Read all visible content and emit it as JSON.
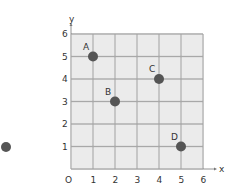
{
  "chart_data": {
    "type": "scatter",
    "title": "",
    "xlabel": "x",
    "ylabel": "y",
    "origin_label": "O",
    "xlim": [
      0,
      6
    ],
    "ylim": [
      0,
      6
    ],
    "grid": true,
    "x_ticks": [
      "1",
      "2",
      "3",
      "4",
      "5",
      "6"
    ],
    "y_ticks": [
      "1",
      "2",
      "3",
      "4",
      "5",
      "6"
    ],
    "points": [
      {
        "label": "A",
        "x": 1,
        "y": 5
      },
      {
        "label": "B",
        "x": 2,
        "y": 3
      },
      {
        "label": "C",
        "x": 4,
        "y": 4
      },
      {
        "label": "D",
        "x": 5,
        "y": 1
      }
    ]
  },
  "colors": {
    "cell_fill": "#ebebeb",
    "grid_line": "#a8a8a8",
    "point": "#555555"
  }
}
